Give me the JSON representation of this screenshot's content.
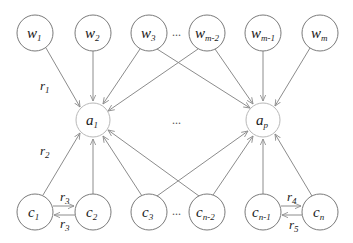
{
  "diagram": {
    "type": "bipartite graph",
    "top_nodes": [
      {
        "id": "w1",
        "base": "w",
        "sub": "1",
        "x": 35,
        "y": 33
      },
      {
        "id": "w2",
        "base": "w",
        "sub": "2",
        "x": 93,
        "y": 33
      },
      {
        "id": "w3",
        "base": "w",
        "sub": "3",
        "x": 149,
        "y": 33
      },
      {
        "id": "wm2",
        "base": "w",
        "sub": "m-2",
        "x": 207,
        "y": 33
      },
      {
        "id": "wm1",
        "base": "w",
        "sub": "m-1",
        "x": 263,
        "y": 33
      },
      {
        "id": "wm",
        "base": "w",
        "sub": "m",
        "x": 320,
        "y": 33
      }
    ],
    "middle_nodes": [
      {
        "id": "a1",
        "base": "a",
        "sub": "1",
        "x": 93,
        "y": 120
      },
      {
        "id": "ap",
        "base": "a",
        "sub": "p",
        "x": 263,
        "y": 120
      }
    ],
    "bottom_nodes": [
      {
        "id": "c1",
        "base": "c",
        "sub": "1",
        "x": 35,
        "y": 212
      },
      {
        "id": "c2",
        "base": "c",
        "sub": "2",
        "x": 93,
        "y": 212
      },
      {
        "id": "c3",
        "base": "c",
        "sub": "3",
        "x": 149,
        "y": 212
      },
      {
        "id": "cn2",
        "base": "c",
        "sub": "n-2",
        "x": 207,
        "y": 212
      },
      {
        "id": "cn1",
        "base": "c",
        "sub": "n-1",
        "x": 263,
        "y": 212
      },
      {
        "id": "cn",
        "base": "c",
        "sub": "n",
        "x": 320,
        "y": 212
      }
    ],
    "edges": [
      {
        "from": "w1",
        "to": "a1",
        "label": "r1"
      },
      {
        "from": "w2",
        "to": "a1"
      },
      {
        "from": "w3",
        "to": "a1"
      },
      {
        "from": "w3",
        "to": "ap"
      },
      {
        "from": "wm2",
        "to": "a1"
      },
      {
        "from": "wm2",
        "to": "ap"
      },
      {
        "from": "wm1",
        "to": "ap"
      },
      {
        "from": "wm",
        "to": "ap"
      },
      {
        "from": "c1",
        "to": "a1",
        "label": "r2"
      },
      {
        "from": "c2",
        "to": "a1"
      },
      {
        "from": "c3",
        "to": "a1"
      },
      {
        "from": "c3",
        "to": "ap"
      },
      {
        "from": "cn2",
        "to": "a1"
      },
      {
        "from": "cn2",
        "to": "ap"
      },
      {
        "from": "cn1",
        "to": "ap"
      },
      {
        "from": "cn",
        "to": "ap"
      },
      {
        "from": "c1",
        "to": "c2",
        "label": "r3"
      },
      {
        "from": "c2",
        "to": "c1",
        "label": "r3"
      },
      {
        "from": "cn1",
        "to": "cn",
        "label": "r4"
      },
      {
        "from": "cn",
        "to": "cn1",
        "label": "r5"
      }
    ],
    "edge_labels": {
      "r1": {
        "base": "r",
        "sub": "1"
      },
      "r2": {
        "base": "r",
        "sub": "2"
      },
      "r3a": {
        "base": "r",
        "sub": "3"
      },
      "r3b": {
        "base": "r",
        "sub": "3"
      },
      "r4": {
        "base": "r",
        "sub": "4"
      },
      "r5": {
        "base": "r",
        "sub": "5"
      }
    },
    "ellipsis": "..."
  }
}
